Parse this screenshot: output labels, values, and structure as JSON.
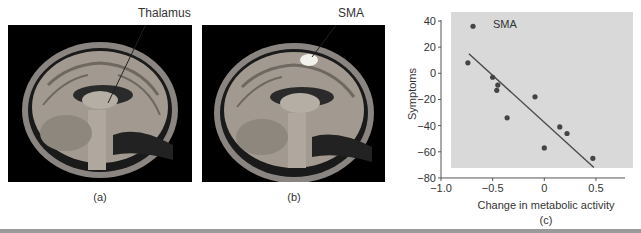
{
  "figure": {
    "panels": [
      {
        "id": "a",
        "caption": "(a)",
        "annotation": "Thalamus"
      },
      {
        "id": "b",
        "caption": "(b)",
        "annotation": "SMA"
      },
      {
        "id": "c",
        "caption": "(c)"
      }
    ]
  },
  "chart_data": {
    "type": "scatter",
    "title": "",
    "annotation": "SMA",
    "xlabel": "Change in metabolic activity",
    "ylabel": "Symptoms",
    "xlim": [
      -1.0,
      0.75
    ],
    "ylim": [
      -80,
      40
    ],
    "xticks": [
      -1.0,
      -0.5,
      0,
      0.5
    ],
    "xtick_labels": [
      "−1.0",
      "−0.5",
      "0",
      "0.5"
    ],
    "yticks": [
      40,
      20,
      0,
      -20,
      -40,
      -60,
      -80
    ],
    "ytick_labels": [
      "40",
      "20",
      "0",
      "−20",
      "−40",
      "−60",
      "−80"
    ],
    "grid": false,
    "legend": null,
    "background": "#d9d9d9",
    "point_color": "#444444",
    "series": [
      {
        "name": "subjects",
        "x": [
          -0.69,
          -0.74,
          -0.5,
          -0.45,
          -0.46,
          -0.36,
          -0.09,
          0.0,
          0.15,
          0.22,
          0.47
        ],
        "y": [
          36,
          8,
          -3,
          -9,
          -13,
          -34,
          -18,
          -57,
          -41,
          -46,
          -65
        ]
      }
    ],
    "fit_line": {
      "x": [
        -0.73,
        0.48
      ],
      "y": [
        15,
        -72
      ]
    }
  }
}
